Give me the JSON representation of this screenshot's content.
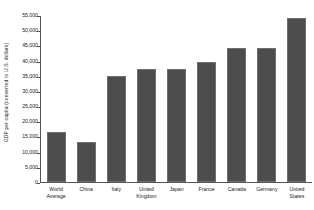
{
  "chart_data": {
    "type": "bar",
    "title": "",
    "xlabel": "",
    "ylabel": "GDP per capita (converted to U.S. dollars)",
    "ylim": [
      0,
      55000
    ],
    "ytick_step": 5000,
    "grid": false,
    "legend": "none",
    "bar_color": "#4d4d4d",
    "axis_color": "#555555",
    "background_color": "#ffffff",
    "categories": [
      "World Average",
      "China",
      "Italy",
      "United Kingdom",
      "Japan",
      "France",
      "Canada",
      "Germany",
      "United States"
    ],
    "values": [
      16500,
      13300,
      35000,
      37200,
      37200,
      39500,
      44000,
      44000,
      54000
    ],
    "ytick_labels": [
      "55,000",
      "50,000",
      "45,000",
      "40,000",
      "35,000",
      "30,000",
      "25,000",
      "20,000",
      "15,000",
      "10,000",
      "5,000",
      "0"
    ],
    "ytick_values": [
      55000,
      50000,
      45000,
      40000,
      35000,
      30000,
      25000,
      20000,
      15000,
      10000,
      5000,
      0
    ]
  }
}
